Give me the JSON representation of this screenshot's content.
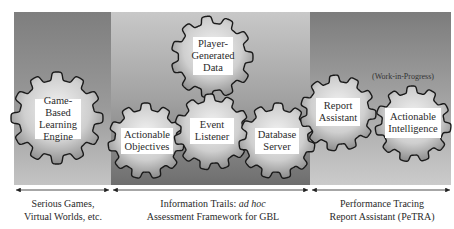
{
  "diagram": {
    "sections": [
      {
        "id": "left",
        "caption_line1": "Serious Games,",
        "caption_line2": "Virtual Worlds, etc."
      },
      {
        "id": "middle",
        "caption_line1_prefix": "Information Trails: ",
        "caption_line1_italic": "ad hoc",
        "caption_line2": "Assessment Framework for GBL"
      },
      {
        "id": "right",
        "caption_line1": "Performance Tracing",
        "caption_line2": "Report Assistant (PeTRA)"
      }
    ],
    "gears": [
      {
        "id": "game-based-learning-engine",
        "label": "Game-Based Learning Engine",
        "section": "left"
      },
      {
        "id": "actionable-objectives",
        "label": "Actionable Objectives",
        "section": "middle"
      },
      {
        "id": "player-generated-data",
        "label": "Player-Generated Data",
        "section": "middle"
      },
      {
        "id": "event-listener",
        "label": "Event Listener",
        "section": "middle"
      },
      {
        "id": "database-server",
        "label": "Database Server",
        "section": "middle"
      },
      {
        "id": "report-assistant",
        "label": "Report Assistant",
        "section": "right"
      },
      {
        "id": "actionable-intelligence",
        "label": "Actionable Intelligence",
        "section": "right"
      }
    ],
    "annotations": {
      "work_in_progress": "(Work-in-Progress)"
    },
    "colors": {
      "panel_dark": "#7a7a7a",
      "panel_light": "#bdbdbd",
      "gear_outline": "#1a1a1a",
      "label_bg": "#ffffff"
    }
  }
}
